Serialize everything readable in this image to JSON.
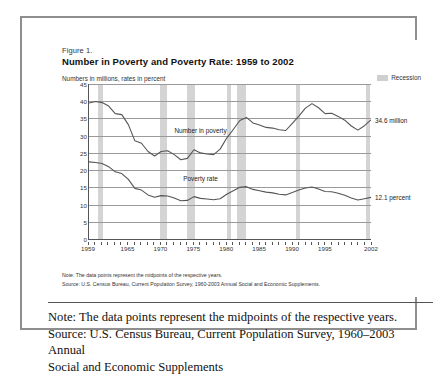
{
  "figure": {
    "number": "Figure 1.",
    "title": "Number in Poverty and Poverty Rate:  1959 to 2002",
    "axis_note": "Numbers in millions, rates in percent",
    "legend_label": "Recession",
    "footnote_note": "Note:  The data points represent the midpoints of the respective years.",
    "footnote_source": "Source:  U.S. Census Bureau, Current Population Survey, 1960-2003 Annual Social and Economic Supplements."
  },
  "caption": {
    "line1": "Note: The data points represent the midpoints of the respective years.",
    "line2": "Source: U.S. Census Bureau, Current Population Survey, 1960–2003 Annual",
    "line3": "Social and Economic Supplements"
  },
  "colors": {
    "line": "#555555",
    "gridline": "#9a9a9a",
    "recession_band": "#d4d4d4",
    "frame": "#8e8e8e",
    "text": "#333333"
  },
  "chart_data": {
    "type": "line",
    "title": "Number in Poverty and Poverty Rate: 1959 to 2002",
    "subtitle": "Numbers in millions, rates in percent",
    "xlabel": "",
    "ylabel": "",
    "xlim": [
      1959,
      2002
    ],
    "ylim": [
      0,
      45
    ],
    "grid": true,
    "legend_position": "top-right",
    "yticks": [
      0,
      5,
      10,
      15,
      20,
      25,
      30,
      35,
      40,
      45
    ],
    "xticks": [
      1959,
      1965,
      1970,
      1975,
      1980,
      1985,
      1990,
      1995,
      2002
    ],
    "annotations": [
      {
        "text": "Number in poverty",
        "series": "Number in poverty",
        "x": 1976,
        "y": 30.5
      },
      {
        "text": "Poverty rate",
        "series": "Poverty rate",
        "x": 1976,
        "y": 16.5
      },
      {
        "text": "34.6 million",
        "series": "Number in poverty",
        "x": 2002,
        "y": 34.6
      },
      {
        "text": "12.1 percent",
        "series": "Poverty rate",
        "x": 2002,
        "y": 12.1
      }
    ],
    "end_values": {
      "number_in_poverty": "34.6 million",
      "poverty_rate": "12.1 percent"
    },
    "recessions": [
      {
        "start": 1960.3,
        "end": 1961.2
      },
      {
        "start": 1969.9,
        "end": 1970.9
      },
      {
        "start": 1973.9,
        "end": 1975.2
      },
      {
        "start": 1980.1,
        "end": 1980.6
      },
      {
        "start": 1981.6,
        "end": 1982.9
      },
      {
        "start": 1990.6,
        "end": 1991.2
      },
      {
        "start": 2001.2,
        "end": 2001.9
      }
    ],
    "x": [
      1959,
      1960,
      1961,
      1962,
      1963,
      1964,
      1965,
      1966,
      1967,
      1968,
      1969,
      1970,
      1971,
      1972,
      1973,
      1974,
      1975,
      1976,
      1977,
      1978,
      1979,
      1980,
      1981,
      1982,
      1983,
      1984,
      1985,
      1986,
      1987,
      1988,
      1989,
      1990,
      1991,
      1992,
      1993,
      1994,
      1995,
      1996,
      1997,
      1998,
      1999,
      2000,
      2001,
      2002
    ],
    "series": [
      {
        "name": "Number in poverty",
        "unit": "millions",
        "values": [
          39.5,
          39.9,
          39.6,
          38.6,
          36.4,
          36.1,
          33.2,
          28.5,
          27.8,
          25.4,
          24.1,
          25.4,
          25.6,
          24.5,
          23.0,
          23.4,
          25.9,
          25.0,
          24.7,
          24.5,
          26.1,
          29.3,
          31.8,
          34.4,
          35.3,
          33.7,
          33.1,
          32.4,
          32.2,
          31.7,
          31.5,
          33.6,
          35.7,
          38.0,
          39.3,
          38.1,
          36.4,
          36.5,
          35.6,
          34.5,
          32.8,
          31.6,
          32.9,
          34.6
        ]
      },
      {
        "name": "Poverty rate",
        "unit": "percent",
        "values": [
          22.4,
          22.2,
          21.9,
          21.0,
          19.5,
          19.0,
          17.3,
          14.7,
          14.2,
          12.8,
          12.1,
          12.6,
          12.5,
          11.9,
          11.1,
          11.2,
          12.3,
          11.8,
          11.6,
          11.4,
          11.7,
          13.0,
          14.0,
          15.0,
          15.2,
          14.4,
          14.0,
          13.6,
          13.4,
          13.0,
          12.8,
          13.5,
          14.2,
          14.8,
          15.1,
          14.5,
          13.8,
          13.7,
          13.3,
          12.7,
          11.9,
          11.3,
          11.7,
          12.1
        ]
      }
    ]
  }
}
